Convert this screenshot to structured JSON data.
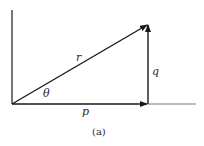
{
  "diagram": {
    "caption": "(a)",
    "labels": {
      "hypotenuse": "r",
      "vertical": "q",
      "horizontal": "p",
      "angle": "θ"
    },
    "colors": {
      "line": "#1a1a1a",
      "baseline_extension": "#777777",
      "background": "#ffffff"
    },
    "geometry": {
      "origin": [
        12,
        104
      ],
      "apex": [
        148,
        24
      ],
      "foot": [
        148,
        104
      ]
    }
  }
}
